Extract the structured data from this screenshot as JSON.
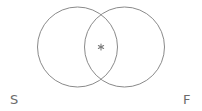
{
  "diagram": {
    "type": "venn",
    "stroke_color": "#8a8a8a",
    "sets": [
      {
        "id": "S",
        "label": "S",
        "cx": 77.5,
        "cy": 47,
        "r": 40
      },
      {
        "id": "F",
        "label": "F",
        "cx": 124.5,
        "cy": 47,
        "r": 40
      }
    ],
    "intersection_marker": {
      "symbol": "*",
      "x": 101,
      "y": 47
    }
  },
  "labels": {
    "left": "S",
    "right": "F"
  }
}
